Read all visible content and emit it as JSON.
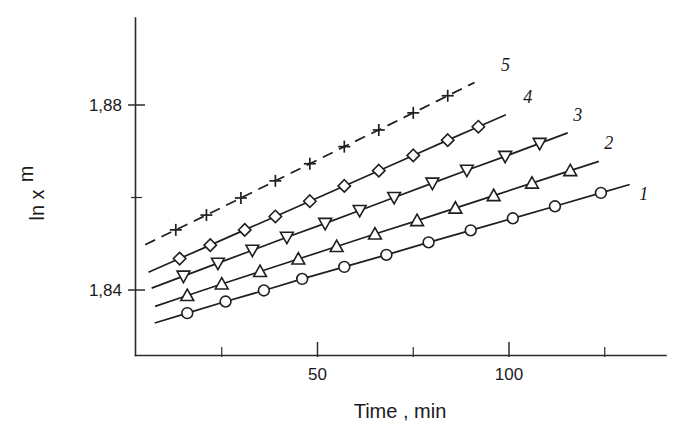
{
  "chart_data": {
    "type": "line",
    "title": "",
    "subtitle": "",
    "xlabel": "Time , min",
    "ylabel": "ln x",
    "ylabel_sub": "m",
    "xlim": [
      0,
      140
    ],
    "ylim": [
      1.826,
      1.902
    ],
    "grid": false,
    "legend_position": "inline-right-of-each-curve",
    "x_ticks_major": [
      50,
      100
    ],
    "x_ticks_major_labels": [
      "50",
      "100"
    ],
    "x_ticks_minor": [
      25,
      75,
      125
    ],
    "y_ticks_major": [
      1.88,
      1.84
    ],
    "y_ticks_major_labels": [
      "1,88",
      "1,84"
    ],
    "y_ticks_minor": [
      1.86
    ],
    "series": [
      {
        "name": "1",
        "label": "1",
        "marker": "circle",
        "linestyle": "solid",
        "x": [
          16,
          26,
          36,
          46,
          57,
          68,
          79,
          90,
          101,
          112,
          124
        ],
        "y": [
          1.835,
          1.8375,
          1.8399,
          1.8424,
          1.845,
          1.8476,
          1.8503,
          1.8529,
          1.8555,
          1.8581,
          1.861
        ]
      },
      {
        "name": "2",
        "label": "2",
        "marker": "triangle-up",
        "linestyle": "solid",
        "x": [
          16,
          25,
          35,
          45,
          55,
          65,
          76,
          86,
          96,
          106,
          116
        ],
        "y": [
          1.8388,
          1.8413,
          1.844,
          1.8467,
          1.8494,
          1.8521,
          1.855,
          1.8577,
          1.8604,
          1.8631,
          1.8658
        ]
      },
      {
        "name": "3",
        "label": "3",
        "marker": "triangle-down",
        "linestyle": "solid",
        "x": [
          15,
          24,
          33,
          42,
          52,
          61,
          70,
          80,
          89,
          99,
          108
        ],
        "y": [
          1.843,
          1.8458,
          1.8486,
          1.8514,
          1.8544,
          1.8572,
          1.86,
          1.8631,
          1.8659,
          1.8689,
          1.8717
        ]
      },
      {
        "name": "4",
        "label": "4",
        "marker": "diamond",
        "linestyle": "solid",
        "x": [
          14,
          22,
          31,
          39,
          48,
          57,
          66,
          75,
          84,
          92
        ],
        "y": [
          1.8468,
          1.8497,
          1.853,
          1.8559,
          1.8592,
          1.8625,
          1.8658,
          1.8691,
          1.8724,
          1.8753
        ]
      },
      {
        "name": "5",
        "label": "5",
        "marker": "plus",
        "linestyle": "dashed",
        "x": [
          13,
          21,
          30,
          39,
          48,
          57,
          66,
          75,
          84
        ],
        "y": [
          1.853,
          1.8562,
          1.8599,
          1.8636,
          1.8673,
          1.871,
          1.8746,
          1.8783,
          1.882
        ]
      }
    ]
  },
  "colors": {
    "ink": "#1f1f1f",
    "axis": "#2b2b2b",
    "background": "#ffffff",
    "marker_fill": "#ffffff"
  }
}
